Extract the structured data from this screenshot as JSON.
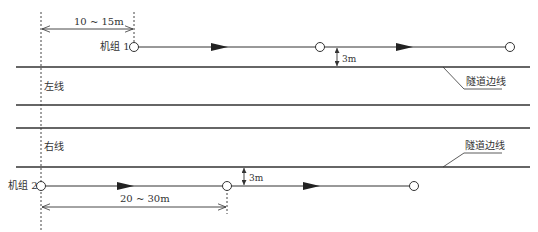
{
  "diagram": {
    "colors": {
      "line": "#333333",
      "text": "#333333",
      "background": "#ffffff"
    },
    "tunnels": [
      {
        "label": "左线",
        "top_y": 67,
        "bottom_y": 105
      },
      {
        "label": "右线",
        "top_y": 128,
        "bottom_y": 167
      }
    ],
    "tunnel_edge_labels": [
      {
        "label": "隧道边线"
      },
      {
        "label": "隧道边线"
      }
    ],
    "units": [
      {
        "label": "机组 1",
        "path_y": 47,
        "nodes_x": [
          134,
          320,
          510
        ],
        "arrows_x": [
          220,
          405
        ]
      },
      {
        "label": "机组 2",
        "path_y": 186,
        "nodes_x": [
          41,
          227,
          414
        ],
        "arrows_x": [
          125,
          310
        ]
      }
    ],
    "dimensions": [
      {
        "label": "10 ~ 15m",
        "from_x": 41,
        "to_x": 134,
        "y": 29
      },
      {
        "label": "20 ~ 30m",
        "from_x": 41,
        "to_x": 227,
        "y": 207
      },
      {
        "label": "3m",
        "x": 337,
        "from_y": 47,
        "to_y": 67
      },
      {
        "label": "3m",
        "x": 244,
        "from_y": 167,
        "to_y": 186
      }
    ]
  }
}
